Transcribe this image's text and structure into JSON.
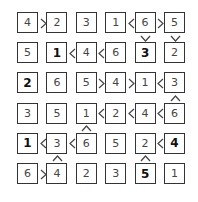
{
  "puzzle": {
    "type": "futoshiki",
    "size": 6,
    "grid": [
      [
        4,
        2,
        3,
        1,
        6,
        5
      ],
      [
        5,
        1,
        4,
        6,
        3,
        2
      ],
      [
        2,
        6,
        5,
        4,
        1,
        3
      ],
      [
        3,
        5,
        1,
        2,
        4,
        6
      ],
      [
        1,
        3,
        6,
        5,
        2,
        4
      ],
      [
        6,
        4,
        2,
        3,
        5,
        1
      ]
    ],
    "givens": [
      [
        false,
        false,
        false,
        false,
        false,
        false
      ],
      [
        false,
        true,
        false,
        false,
        true,
        false
      ],
      [
        true,
        false,
        false,
        false,
        false,
        false
      ],
      [
        false,
        false,
        false,
        false,
        false,
        false
      ],
      [
        true,
        false,
        false,
        false,
        false,
        true
      ],
      [
        false,
        false,
        false,
        false,
        true,
        false
      ]
    ],
    "horizontal_constraints": [
      {
        "row": 0,
        "col": 0,
        "sign": ">"
      },
      {
        "row": 0,
        "col": 3,
        "sign": "<"
      },
      {
        "row": 0,
        "col": 4,
        "sign": ">"
      },
      {
        "row": 1,
        "col": 1,
        "sign": "<"
      },
      {
        "row": 1,
        "col": 2,
        "sign": "<"
      },
      {
        "row": 2,
        "col": 2,
        "sign": ">"
      },
      {
        "row": 2,
        "col": 3,
        "sign": ">"
      },
      {
        "row": 2,
        "col": 4,
        "sign": "<"
      },
      {
        "row": 3,
        "col": 2,
        "sign": "<"
      },
      {
        "row": 3,
        "col": 3,
        "sign": "<"
      },
      {
        "row": 3,
        "col": 4,
        "sign": "<"
      },
      {
        "row": 4,
        "col": 0,
        "sign": "<"
      },
      {
        "row": 4,
        "col": 1,
        "sign": "<"
      },
      {
        "row": 4,
        "col": 4,
        "sign": "<"
      },
      {
        "row": 5,
        "col": 0,
        "sign": ">"
      }
    ],
    "vertical_constraints": [
      {
        "row": 0,
        "col": 4,
        "sign": "v"
      },
      {
        "row": 0,
        "col": 5,
        "sign": "v"
      },
      {
        "row": 2,
        "col": 5,
        "sign": "^"
      },
      {
        "row": 3,
        "col": 2,
        "sign": "^"
      },
      {
        "row": 4,
        "col": 1,
        "sign": "^"
      },
      {
        "row": 4,
        "col": 4,
        "sign": "^"
      }
    ]
  },
  "colors": {
    "border": "#333333",
    "text": "#444444",
    "given_text": "#111111",
    "background": "#ffffff"
  }
}
